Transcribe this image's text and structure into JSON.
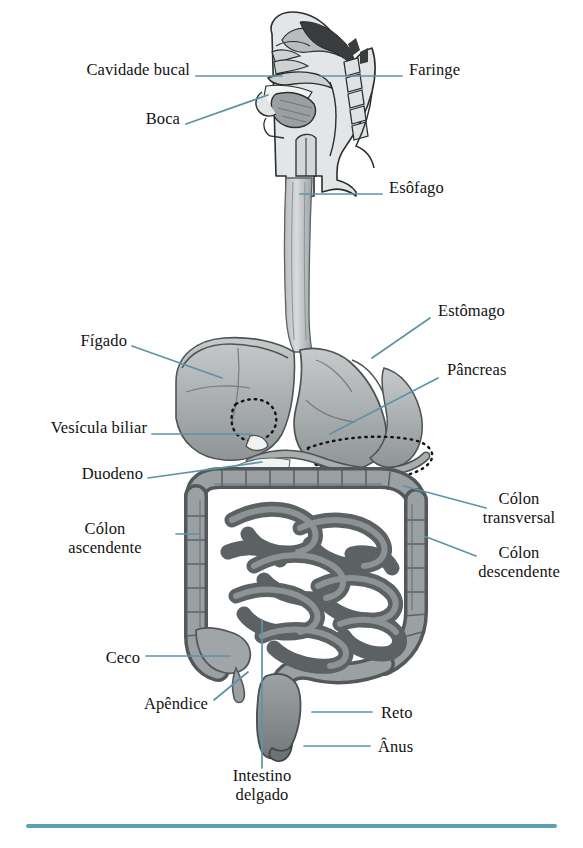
{
  "diagram": {
    "language": "pt-BR",
    "leader_color": "#5d93a8",
    "rule_color": "#5e9fb5",
    "background": "#ffffff",
    "art_style": "grayscale anatomical illustration",
    "labels": [
      {
        "id": "cavidade-bucal",
        "text": "Cavidade bucal",
        "side": "left",
        "x": 58,
        "y": 68
      },
      {
        "id": "boca",
        "text": "Boca",
        "side": "left",
        "x": 139,
        "y": 117
      },
      {
        "id": "faringe",
        "text": "Faringe",
        "side": "right",
        "x": 409,
        "y": 68
      },
      {
        "id": "esofago",
        "text": "Esôfago",
        "side": "right",
        "x": 389,
        "y": 185
      },
      {
        "id": "figado",
        "text": "Fígado",
        "side": "left",
        "x": 77,
        "y": 339
      },
      {
        "id": "estomago",
        "text": "Estômago",
        "side": "right",
        "x": 438,
        "y": 308
      },
      {
        "id": "pancreas",
        "text": "Pâncreas",
        "side": "right",
        "x": 447,
        "y": 367
      },
      {
        "id": "vesicula",
        "text": "Vesícula biliar",
        "side": "left",
        "x": 18,
        "y": 426
      },
      {
        "id": "duodeno",
        "text": "Duodeno",
        "side": "left",
        "x": 70,
        "y": 472
      },
      {
        "id": "colon-transversal",
        "text": "Cólon\ntransversal",
        "side": "right",
        "x": 493,
        "y": 494
      },
      {
        "id": "colon-descendente",
        "text": "Cólon\ndescendente",
        "side": "right",
        "x": 466,
        "y": 548
      },
      {
        "id": "colon-ascendente",
        "text": "Cólon\nascendente",
        "side": "left",
        "x": 58,
        "y": 524
      },
      {
        "id": "ceco",
        "text": "Ceco",
        "side": "left",
        "x": 96,
        "y": 648
      },
      {
        "id": "apendice",
        "text": "Apêndice",
        "side": "left",
        "x": 136,
        "y": 695
      },
      {
        "id": "reto",
        "text": "Reto",
        "side": "right",
        "x": 381,
        "y": 703
      },
      {
        "id": "anus",
        "text": "Ânus",
        "side": "right",
        "x": 378,
        "y": 737
      },
      {
        "id": "intestino-delgado",
        "text": "Intestino\ndelgado",
        "side": "bottom",
        "x": 219,
        "y": 770
      }
    ],
    "organs": [
      "cavidade bucal",
      "boca",
      "faringe",
      "esôfago",
      "fígado",
      "estômago",
      "pâncreas",
      "vesícula biliar",
      "duodeno",
      "cólon transversal",
      "cólon descendente",
      "cólon ascendente",
      "ceco",
      "apêndice",
      "reto",
      "ânus",
      "intestino delgado"
    ]
  }
}
